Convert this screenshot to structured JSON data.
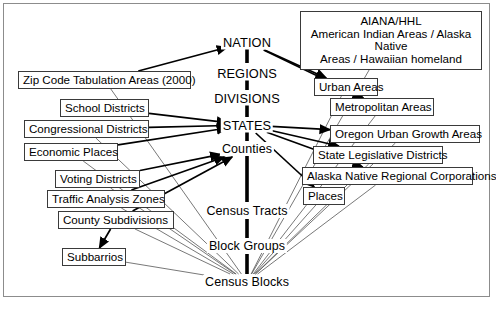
{
  "diagram": {
    "background_color": "#ffffff",
    "line_color": "#000000",
    "border_color": "#8c8c8c"
  },
  "hierarchy": {
    "label": "central-spine",
    "nodes": [
      {
        "id": "nation",
        "label": "NATION",
        "x": 247,
        "y": 42,
        "style": "caps"
      },
      {
        "id": "regions",
        "label": "REGIONS",
        "x": 247,
        "y": 73,
        "style": "caps"
      },
      {
        "id": "divisions",
        "label": "DIVISIONS",
        "x": 247,
        "y": 98,
        "style": "caps"
      },
      {
        "id": "states",
        "label": "STATES",
        "x": 247,
        "y": 125,
        "style": "caps"
      },
      {
        "id": "counties",
        "label": "Counties",
        "x": 247,
        "y": 149,
        "style": "normal"
      },
      {
        "id": "census-tracts",
        "label": "Census Tracts",
        "x": 247,
        "y": 211,
        "style": "normal"
      },
      {
        "id": "block-groups",
        "label": "Block Groups",
        "x": 247,
        "y": 246,
        "style": "normal"
      },
      {
        "id": "census-blocks",
        "label": "Census Blocks",
        "x": 247,
        "y": 282,
        "style": "normal"
      }
    ]
  },
  "left_boxes": [
    {
      "id": "zip-code-tabulation-areas",
      "label": "Zip Code Tabulation Areas (2000)",
      "x": 18,
      "y": 71,
      "w": 173,
      "h": 18
    },
    {
      "id": "school-districts",
      "label": "School Districts",
      "x": 60,
      "y": 99,
      "w": 89,
      "h": 18
    },
    {
      "id": "congressional-districts",
      "label": "Congressional Districts",
      "x": 24,
      "y": 120,
      "w": 125,
      "h": 18
    },
    {
      "id": "economic-places",
      "label": "Economic Places",
      "x": 24,
      "y": 143,
      "w": 94,
      "h": 18
    },
    {
      "id": "voting-districts",
      "label": "Voting Districts",
      "x": 55,
      "y": 170,
      "w": 85,
      "h": 18
    },
    {
      "id": "traffic-analysis-zones",
      "label": "Traffic Analysis Zones",
      "x": 47,
      "y": 190,
      "w": 118,
      "h": 18
    },
    {
      "id": "county-subdivisions",
      "label": "County Subdivisions",
      "x": 58,
      "y": 211,
      "w": 116,
      "h": 18
    },
    {
      "id": "subbarrios",
      "label": "Subbarrios",
      "x": 62,
      "y": 248,
      "w": 64,
      "h": 18
    }
  ],
  "right_boxes": [
    {
      "id": "aiana-hhl",
      "x": 300,
      "y": 11,
      "w": 182,
      "h": 42,
      "multiline": true,
      "lines": [
        "AIANA/HHL",
        "American Indian Areas / Alaska Native",
        "Areas / Hawaiian homeland"
      ]
    },
    {
      "id": "urban-areas",
      "label": "Urban Areas",
      "x": 314,
      "y": 78,
      "w": 64,
      "h": 18
    },
    {
      "id": "metropolitan-areas",
      "label": "Metropolitan Areas",
      "x": 330,
      "y": 98,
      "w": 104,
      "h": 18
    },
    {
      "id": "oregon-urban-growth-areas",
      "label": "Oregon Urban Growth Areas",
      "x": 330,
      "y": 125,
      "w": 150,
      "h": 18
    },
    {
      "id": "state-legislative-districts",
      "label": "State Legislative Districts",
      "x": 313,
      "y": 146,
      "w": 130,
      "h": 18
    },
    {
      "id": "alaska-native-regional-corporations",
      "label": "Alaska Native Regional Corporations",
      "x": 302,
      "y": 167,
      "w": 171,
      "h": 18
    },
    {
      "id": "places",
      "label": "Places",
      "x": 303,
      "y": 187,
      "w": 42,
      "h": 18
    }
  ],
  "spine_segments": [
    {
      "id": "seg-nation-regions",
      "x": 247,
      "y1": 49,
      "y2": 63
    },
    {
      "id": "seg-regions-divisions",
      "x": 247,
      "y1": 80,
      "y2": 90
    },
    {
      "id": "seg-divisions-states",
      "x": 247,
      "y1": 105,
      "y2": 117
    },
    {
      "id": "seg-states-counties",
      "x": 247,
      "y1": 132,
      "y2": 141
    },
    {
      "id": "seg-counties-tracts",
      "x": 247,
      "y1": 156,
      "y2": 202
    },
    {
      "id": "seg-tracts-blockgroups",
      "x": 247,
      "y1": 219,
      "y2": 238
    },
    {
      "id": "seg-blockgroups-blocks",
      "x": 247,
      "y1": 254,
      "y2": 274
    }
  ],
  "thick_links": [
    {
      "id": "link-nation-zipcode",
      "from": "zip-code-tabulation-areas",
      "to": "nation"
    },
    {
      "id": "link-nation-urban-areas",
      "from": "nation",
      "to": "urban-areas"
    },
    {
      "id": "link-nation-metropolitan-areas",
      "from": "nation",
      "to": "metropolitan-areas"
    },
    {
      "id": "link-states-school-districts",
      "from": "school-districts",
      "to": "states"
    },
    {
      "id": "link-states-congressional-districts",
      "from": "congressional-districts",
      "to": "states"
    },
    {
      "id": "link-states-economic-places",
      "from": "economic-places",
      "to": "states"
    },
    {
      "id": "link-states-oregon-urban-growth",
      "from": "states",
      "to": "oregon-urban-growth-areas"
    },
    {
      "id": "link-states-state-legislative",
      "from": "states",
      "to": "state-legislative-districts"
    },
    {
      "id": "link-states-alaska-native-corps",
      "from": "states",
      "to": "alaska-native-regional-corporations"
    },
    {
      "id": "link-states-places",
      "from": "states",
      "to": "places"
    },
    {
      "id": "link-counties-voting-districts",
      "from": "voting-districts",
      "to": "counties"
    },
    {
      "id": "link-counties-traffic-analysis",
      "from": "traffic-analysis-zones",
      "to": "counties"
    },
    {
      "id": "link-counties-county-subdivisions",
      "from": "county-subdivisions",
      "to": "counties"
    },
    {
      "id": "link-county-subdivisions-subbarrios",
      "from": "county-subdivisions",
      "to": "subbarrios"
    }
  ],
  "thin_links": [
    {
      "id": "thin-zipcode-blocks",
      "from": "zip-code-tabulation-areas",
      "to": "census-blocks"
    },
    {
      "id": "thin-congressional-blocks",
      "from": "congressional-districts",
      "to": "census-blocks"
    },
    {
      "id": "thin-economic-blocks",
      "from": "economic-places",
      "to": "census-blocks"
    },
    {
      "id": "thin-voting-blocks",
      "from": "voting-districts",
      "to": "census-blocks"
    },
    {
      "id": "thin-traffic-blocks",
      "from": "traffic-analysis-zones",
      "to": "census-blocks"
    },
    {
      "id": "thin-countysub-blocks",
      "from": "county-subdivisions",
      "to": "census-blocks"
    },
    {
      "id": "thin-subbarrios-blocks",
      "from": "subbarrios",
      "to": "census-blocks"
    },
    {
      "id": "thin-aiana-blocks",
      "from": "aiana-hhl",
      "to": "census-blocks"
    },
    {
      "id": "thin-urban-blocks",
      "from": "urban-areas",
      "to": "census-blocks"
    },
    {
      "id": "thin-metropolitan-blocks",
      "from": "metropolitan-areas",
      "to": "census-blocks"
    },
    {
      "id": "thin-oregon-blocks",
      "from": "oregon-urban-growth-areas",
      "to": "census-blocks"
    },
    {
      "id": "thin-statelegis-blocks",
      "from": "state-legislative-districts",
      "to": "census-blocks"
    },
    {
      "id": "thin-alaska-blocks",
      "from": "alaska-native-regional-corporations",
      "to": "census-blocks"
    },
    {
      "id": "thin-places-blocks",
      "from": "places",
      "to": "census-blocks"
    }
  ]
}
